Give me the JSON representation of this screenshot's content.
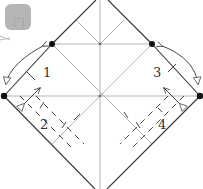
{
  "diagram": {
    "type": "origami-fold-diagram",
    "step_labels": [
      {
        "id": "1",
        "text": "1"
      },
      {
        "id": "2",
        "text": "2"
      },
      {
        "id": "3",
        "text": "3"
      },
      {
        "id": "4",
        "text": "4"
      }
    ],
    "colors": {
      "edge": "#333333",
      "crease": "#b0b0b0",
      "valley": "#444444",
      "dot": "#111111",
      "overlay": "#a9a9a9"
    },
    "reference_points": [
      {
        "name": "upper-left-point",
        "x": 52,
        "y": 44
      },
      {
        "name": "upper-right-point",
        "x": 152,
        "y": 44
      },
      {
        "name": "left-corner",
        "x": 4,
        "y": 96
      },
      {
        "name": "right-corner",
        "x": 200,
        "y": 96
      }
    ]
  },
  "overlay": {
    "icon": "expand-icon"
  }
}
